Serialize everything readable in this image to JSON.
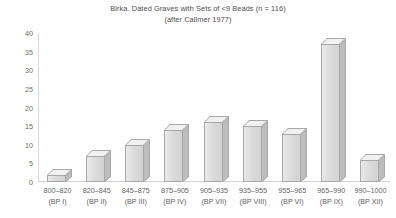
{
  "chart_data": {
    "type": "bar",
    "title": "Birka. Dated Graves with Sets of <9 Beads (n = 116)",
    "subtitle": "(after Callmer 1977)",
    "xlabel": "",
    "ylabel": "",
    "ylim": [
      0,
      40
    ],
    "ytick_step": 5,
    "yticks": [
      "40",
      "35",
      "30",
      "25",
      "20",
      "15",
      "10",
      "5",
      "0"
    ],
    "grid": false,
    "legend": "none",
    "categories": [
      "800–820 (BP I)",
      "820–845 (BP II)",
      "845–875 (BP III)",
      "875–905 (BP IV)",
      "905–935 (BP VII)",
      "935–955 (BP VIII)",
      "955–965 (BP VI)",
      "965–990 (BP IX)",
      "990–1000 (BP XII)"
    ],
    "category_lines": [
      {
        "range": "800–820",
        "phase": "(BP I)"
      },
      {
        "range": "820–845",
        "phase": "(BP II)"
      },
      {
        "range": "845–875",
        "phase": "(BP III)"
      },
      {
        "range": "875–905",
        "phase": "(BP IV)"
      },
      {
        "range": "905–935",
        "phase": "(BP VII)"
      },
      {
        "range": "935–955",
        "phase": "(BP VIII)"
      },
      {
        "range": "955–965",
        "phase": "(BP VI)"
      },
      {
        "range": "965–990",
        "phase": "(BP IX)"
      },
      {
        "range": "990–1000",
        "phase": "(BP XII)"
      }
    ],
    "values": [
      2,
      7,
      10,
      14,
      16,
      15,
      13,
      37,
      6
    ],
    "bar_style": "3d-block-gray",
    "colors": {
      "bar_face": "#dcdcdc",
      "bar_side": "#bdbdbd",
      "bar_top": "#f1f1f1",
      "bar_edge": "#a8a8a8",
      "axis": "#d0d0d0",
      "text": "#5a5a5a",
      "background": "#ffffff"
    }
  }
}
